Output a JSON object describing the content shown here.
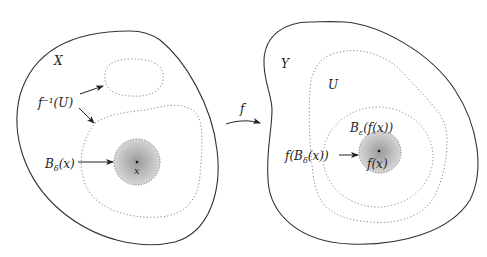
{
  "figure": {
    "domain_space": {
      "label": "X",
      "preimage_label": "f⁻¹(U)",
      "ball_label_main": "B",
      "ball_label_sub": "δ",
      "ball_label_arg": "(x)",
      "point_label": "x"
    },
    "map": {
      "label": "f"
    },
    "codomain_space": {
      "label": "Y",
      "open_set_label": "U",
      "eps_ball_main": "B",
      "eps_ball_sub": "ε",
      "eps_ball_arg": "(f(x))",
      "image_label_pre": "f(B",
      "image_label_sub": "δ",
      "image_label_post": "(x))",
      "point_label": "f(x)"
    },
    "colors": {
      "outline": "#333333",
      "dotted": "#888888",
      "ball_fill_center": "#9a9a9a",
      "ball_fill_edge": "#d4d4d4"
    }
  }
}
